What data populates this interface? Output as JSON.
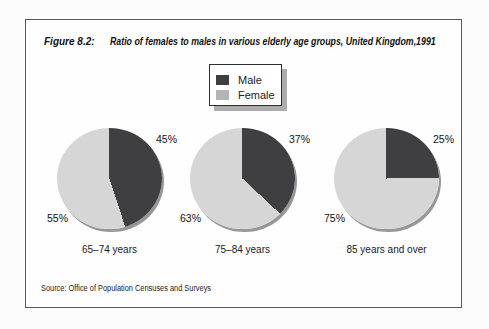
{
  "figure": {
    "label": "Figure 8.2:",
    "title": "Ratio of females to males in various elderly age groups, United Kingdom,1991",
    "source": "Source: Office of Population Censuses and Surveys"
  },
  "legend": {
    "items": [
      {
        "label": "Male",
        "color": "#3f3f41"
      },
      {
        "label": "Female",
        "color": "#b5b5b5"
      }
    ]
  },
  "colors": {
    "male_slice": "#3f3f41",
    "female_slice": "#d6d6d6",
    "pie_rim_shadow": "#979797",
    "frame_border": "#595959",
    "legend_shadow": "#acacac"
  },
  "chart_data": [
    {
      "type": "pie",
      "title": "65–74 years",
      "labels": [
        "Male",
        "Female"
      ],
      "values": [
        45,
        55
      ],
      "value_labels": [
        "45%",
        "55%"
      ],
      "unit": "percent",
      "start_angle_deg": 0,
      "direction": "clockwise",
      "legend_position": "top-center"
    },
    {
      "type": "pie",
      "title": "75–84 years",
      "labels": [
        "Male",
        "Female"
      ],
      "values": [
        37,
        63
      ],
      "value_labels": [
        "37%",
        "63%"
      ],
      "unit": "percent",
      "start_angle_deg": 0,
      "direction": "clockwise",
      "legend_position": "top-center"
    },
    {
      "type": "pie",
      "title": "85 years and over",
      "labels": [
        "Male",
        "Female"
      ],
      "values": [
        25,
        75
      ],
      "value_labels": [
        "25%",
        "75%"
      ],
      "unit": "percent",
      "start_angle_deg": 0,
      "direction": "clockwise",
      "legend_position": "top-center"
    }
  ]
}
